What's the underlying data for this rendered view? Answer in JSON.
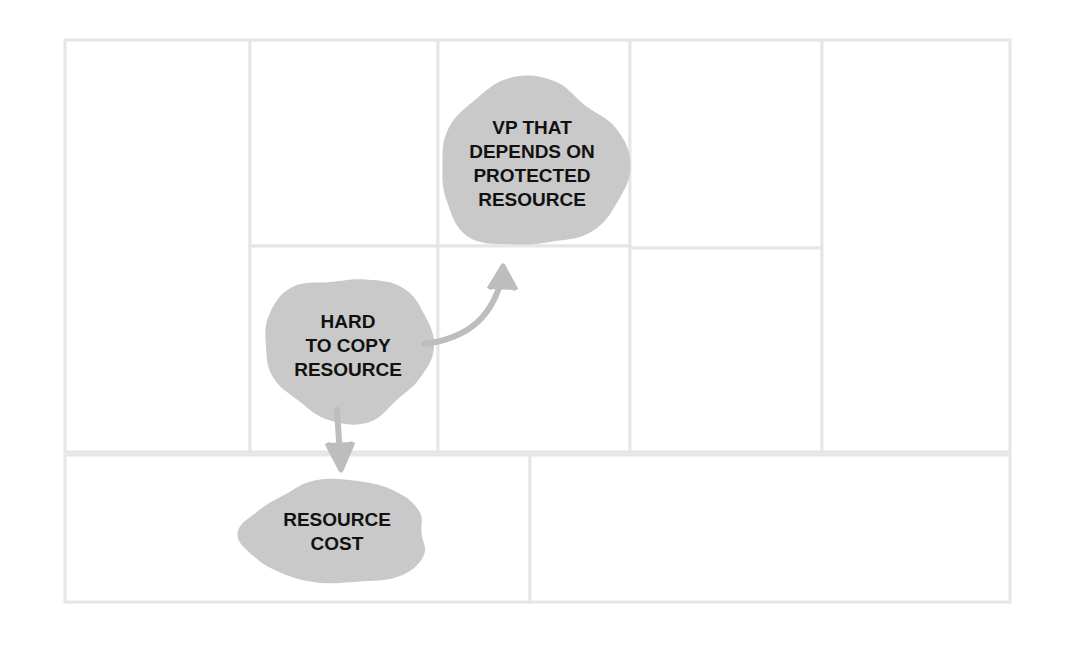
{
  "diagram": {
    "background_color": "#ffffff",
    "grid_line_color": "#e6e6e6",
    "blob_fill_color": "#c9c9c9",
    "blob_text_color": "#111111",
    "arrow_color": "#bdbdbd",
    "frame": {
      "x": 65,
      "y": 40,
      "width": 945,
      "height": 562
    }
  },
  "grid": {
    "columns_top": [
      65,
      250,
      438,
      630,
      822,
      1010
    ],
    "top_row_bounds": {
      "top": 40,
      "bottom": 452
    },
    "bottom_row_bounds": {
      "top": 455,
      "bottom": 602
    },
    "bottom_row_divider_x": 530,
    "cells": [
      {
        "name": "cell-col1-tall",
        "x": 65,
        "y": 40,
        "width": 185,
        "height": 412,
        "label": ""
      },
      {
        "name": "cell-col2-top",
        "x": 250,
        "y": 40,
        "width": 188,
        "height": 206,
        "label": ""
      },
      {
        "name": "cell-col2-bottom",
        "x": 250,
        "y": 246,
        "width": 188,
        "height": 206,
        "label": ""
      },
      {
        "name": "cell-col3-top",
        "x": 438,
        "y": 40,
        "width": 192,
        "height": 206,
        "label": ""
      },
      {
        "name": "cell-col3-bottom",
        "x": 438,
        "y": 246,
        "width": 192,
        "height": 206,
        "label": ""
      },
      {
        "name": "cell-col4-top",
        "x": 630,
        "y": 40,
        "width": 192,
        "height": 208,
        "label": ""
      },
      {
        "name": "cell-col4-bottom",
        "x": 630,
        "y": 248,
        "width": 192,
        "height": 204,
        "label": ""
      },
      {
        "name": "cell-col5-tall",
        "x": 822,
        "y": 40,
        "width": 188,
        "height": 412,
        "label": ""
      },
      {
        "name": "cell-bottom-left",
        "x": 65,
        "y": 455,
        "width": 465,
        "height": 147,
        "label": ""
      },
      {
        "name": "cell-bottom-right",
        "x": 530,
        "y": 455,
        "width": 480,
        "height": 147,
        "label": ""
      }
    ]
  },
  "blobs": [
    {
      "id": "vp-protected-resource",
      "name": "blob-vp-that-depends-on-protected-resource",
      "center": {
        "x": 532,
        "y": 165
      },
      "radius": {
        "x": 94,
        "y": 84
      },
      "lines": [
        "VP THAT",
        "DEPENDS ON",
        "PROTECTED",
        "RESOURCE"
      ],
      "font_size": 19,
      "line_height": 24
    },
    {
      "id": "hard-to-copy-resource",
      "name": "blob-hard-to-copy-resource",
      "center": {
        "x": 348,
        "y": 347
      },
      "radius": {
        "x": 84,
        "y": 72
      },
      "lines": [
        "HARD",
        "TO COPY",
        "RESOURCE"
      ],
      "font_size": 19,
      "line_height": 24
    },
    {
      "id": "resource-cost",
      "name": "blob-resource-cost",
      "center": {
        "x": 337,
        "y": 533
      },
      "radius": {
        "x": 92,
        "y": 52
      },
      "lines": [
        "RESOURCE",
        "COST"
      ],
      "font_size": 19,
      "line_height": 24
    }
  ],
  "arrows": [
    {
      "id": "arrow-hard-to-copy-to-vp",
      "name": "arrow-hard-to-copy-resource-to-vp",
      "from": "hard-to-copy-resource",
      "to": "vp-protected-resource",
      "shape": "curved",
      "path": "M 424 344 C 470 338 492 316 502 278",
      "head": "M 489 289 L 503 266 L 516 290"
    },
    {
      "id": "arrow-hard-to-copy-to-cost",
      "name": "arrow-hard-to-copy-resource-to-resource-cost",
      "from": "hard-to-copy-resource",
      "to": "resource-cost",
      "shape": "straight",
      "path": "M 337 410 L 340 456",
      "head": "M 327 443 L 341 470 L 353 442"
    }
  ]
}
